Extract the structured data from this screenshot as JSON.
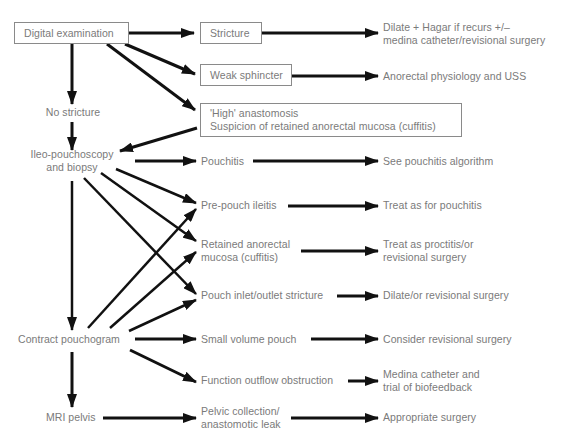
{
  "diagram": {
    "title": "",
    "colors": {
      "text": "#7a7a7a",
      "box_border": "#8a8a8a",
      "arrow": "#111111",
      "background": "#ffffff"
    },
    "nodes": {
      "digital_exam": {
        "lines": [
          "Digital examination"
        ],
        "boxed": true
      },
      "stricture": {
        "lines": [
          "Stricture"
        ],
        "boxed": true
      },
      "weak_sphincter": {
        "lines": [
          "Weak sphincter"
        ],
        "boxed": true
      },
      "high_anastomosis": {
        "lines": [
          "'High' anastomosis",
          "Suspicion of retained anorectal mucosa (cuffitis)"
        ],
        "boxed": true
      },
      "no_stricture": {
        "lines": [
          "No stricture"
        ]
      },
      "ileo_pouchoscopy": {
        "lines": [
          "Ileo-pouchoscopy",
          "and biopsy"
        ]
      },
      "contrast_pouchogram": {
        "lines": [
          "Contract pouchogram"
        ]
      },
      "mri_pelvis": {
        "lines": [
          "MRI pelvis"
        ]
      },
      "pouchitis": {
        "lines": [
          "Pouchitis"
        ]
      },
      "prepouch_ileitis": {
        "lines": [
          "Pre-pouch ileitis"
        ]
      },
      "retained_mucosa": {
        "lines": [
          "Retained anorectal",
          "mucosa (cuffitis)"
        ]
      },
      "inlet_outlet_stricture": {
        "lines": [
          "Pouch inlet/outlet stricture"
        ]
      },
      "small_volume_pouch": {
        "lines": [
          "Small volume pouch"
        ]
      },
      "outflow_obstruction": {
        "lines": [
          "Function outflow obstruction"
        ]
      },
      "pelvic_collection": {
        "lines": [
          "Pelvic collection/",
          "anastomotic leak"
        ]
      },
      "out_stricture": {
        "lines": [
          "Dilate + Hagar if recurs +/–",
          "medina catheter/revisional surgery"
        ]
      },
      "out_sphincter": {
        "lines": [
          "Anorectal physiology and USS"
        ]
      },
      "out_pouchitis": {
        "lines": [
          "See pouchitis algorithm"
        ]
      },
      "out_ileitis": {
        "lines": [
          "Treat as for pouchitis"
        ]
      },
      "out_retained": {
        "lines": [
          "Treat as proctitis/or",
          "revisional surgery"
        ]
      },
      "out_inlet": {
        "lines": [
          "Dilate/or revisional surgery"
        ]
      },
      "out_small_volume": {
        "lines": [
          "Consider revisional surgery"
        ]
      },
      "out_outflow": {
        "lines": [
          "Medina catheter and",
          "trial of biofeedback"
        ]
      },
      "out_pelvic": {
        "lines": [
          "Appropriate surgery"
        ]
      }
    },
    "edges": [
      [
        "digital_exam",
        "stricture"
      ],
      [
        "digital_exam",
        "weak_sphincter"
      ],
      [
        "digital_exam",
        "high_anastomosis"
      ],
      [
        "digital_exam",
        "no_stricture"
      ],
      [
        "no_stricture",
        "ileo_pouchoscopy"
      ],
      [
        "high_anastomosis",
        "ileo_pouchoscopy"
      ],
      [
        "stricture",
        "out_stricture"
      ],
      [
        "weak_sphincter",
        "out_sphincter"
      ],
      [
        "ileo_pouchoscopy",
        "pouchitis"
      ],
      [
        "ileo_pouchoscopy",
        "prepouch_ileitis"
      ],
      [
        "ileo_pouchoscopy",
        "retained_mucosa"
      ],
      [
        "ileo_pouchoscopy",
        "inlet_outlet_stricture"
      ],
      [
        "ileo_pouchoscopy",
        "contrast_pouchogram"
      ],
      [
        "pouchitis",
        "out_pouchitis"
      ],
      [
        "prepouch_ileitis",
        "out_ileitis"
      ],
      [
        "retained_mucosa",
        "out_retained"
      ],
      [
        "inlet_outlet_stricture",
        "out_inlet"
      ],
      [
        "contrast_pouchogram",
        "prepouch_ileitis"
      ],
      [
        "contrast_pouchogram",
        "retained_mucosa"
      ],
      [
        "contrast_pouchogram",
        "inlet_outlet_stricture"
      ],
      [
        "contrast_pouchogram",
        "small_volume_pouch"
      ],
      [
        "contrast_pouchogram",
        "outflow_obstruction"
      ],
      [
        "contrast_pouchogram",
        "mri_pelvis"
      ],
      [
        "small_volume_pouch",
        "out_small_volume"
      ],
      [
        "outflow_obstruction",
        "out_outflow"
      ],
      [
        "mri_pelvis",
        "pelvic_collection"
      ],
      [
        "pelvic_collection",
        "out_pelvic"
      ]
    ]
  }
}
